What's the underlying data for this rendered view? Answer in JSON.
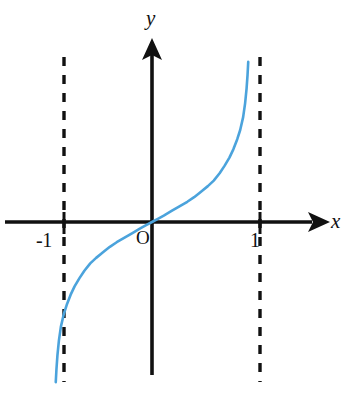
{
  "figure": {
    "background_color": "#ffffff",
    "width": 349,
    "height": 407
  },
  "axes": {
    "x_axis_label": "x",
    "y_axis_label": "y",
    "origin_label": "O",
    "axis_color": "#111111",
    "x_axis_pixel_y": 222,
    "y_axis_pixel_x": 152,
    "x_axis_has_arrow": true,
    "y_axis_has_arrow": true
  },
  "ticks": {
    "x": [
      {
        "label": "-1",
        "value": -1
      },
      {
        "label": "1",
        "value": 1
      }
    ]
  },
  "asymptotes": {
    "style": "dashed",
    "color": "#111111",
    "lines": [
      {
        "axis": "vertical",
        "value": -1
      },
      {
        "axis": "vertical",
        "value": 1
      }
    ]
  },
  "chart_data": {
    "type": "line",
    "title": "",
    "subtitle": "",
    "xlabel": "x",
    "ylabel": "y",
    "xlim": [
      -1.35,
      1.9
    ],
    "ylim": [
      -2.05,
      1.8
    ],
    "grid": false,
    "legend": null,
    "series": [
      {
        "name": "curve",
        "color": "#4BA3DC",
        "line_width": 2.6,
        "description": "odd increasing function with vertical asymptotes at x = -1 and x = 1, passing through the origin",
        "x": [
          -0.982,
          -0.975,
          -0.965,
          -0.95,
          -0.93,
          -0.9,
          -0.87,
          -0.83,
          -0.79,
          -0.74,
          -0.69,
          -0.63,
          -0.57,
          -0.5,
          -0.43,
          -0.36,
          -0.28,
          -0.2,
          -0.12,
          -0.06,
          0.0,
          0.06,
          0.12,
          0.2,
          0.28,
          0.36,
          0.43,
          0.5,
          0.57,
          0.63,
          0.69,
          0.74,
          0.79,
          0.83,
          0.87,
          0.9,
          0.93,
          0.95,
          0.965,
          0.975,
          0.982
        ],
        "y": [
          -1.74,
          -1.6,
          -1.45,
          -1.29,
          -1.14,
          -1.0,
          -0.9,
          -0.79,
          -0.7,
          -0.61,
          -0.53,
          -0.45,
          -0.39,
          -0.33,
          -0.27,
          -0.22,
          -0.17,
          -0.12,
          -0.07,
          -0.035,
          0.0,
          0.035,
          0.07,
          0.12,
          0.17,
          0.22,
          0.27,
          0.33,
          0.39,
          0.45,
          0.53,
          0.61,
          0.7,
          0.79,
          0.9,
          1.0,
          1.14,
          1.29,
          1.45,
          1.6,
          1.74
        ]
      }
    ],
    "annotations": [
      {
        "text": "O",
        "x": -0.1,
        "y": -0.18,
        "role": "origin-label"
      },
      {
        "text": "-1",
        "x": -1.18,
        "y": -0.2,
        "role": "x-tick-label"
      },
      {
        "text": "1",
        "x": 0.9,
        "y": -0.2,
        "role": "x-tick-label"
      },
      {
        "text": "x",
        "x": 1.85,
        "y": 0.1,
        "role": "axis-label"
      },
      {
        "text": "y",
        "x": 0.03,
        "y": 1.75,
        "role": "axis-label"
      }
    ]
  }
}
